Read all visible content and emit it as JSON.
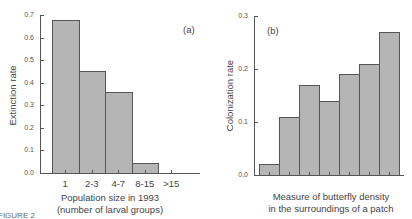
{
  "chart_data": [
    {
      "type": "bar",
      "panel": "(a)",
      "title": "",
      "xlabel": "Population size in 1993",
      "xlabel_line2": "(number of larval groups)",
      "ylabel": "Extinction rate",
      "categories": [
        "1",
        "2-3",
        "4-7",
        "8-15",
        ">15"
      ],
      "values": [
        0.68,
        0.45,
        0.36,
        0.045,
        0.0
      ],
      "ylim": [
        0,
        0.7
      ],
      "yticks": [
        "0.0",
        "0.1",
        "0.2",
        "0.3",
        "0.4",
        "0.5",
        "0.6",
        "0.7"
      ],
      "grid": false
    },
    {
      "type": "bar",
      "panel": "(b)",
      "title": "",
      "xlabel": "Measure of butterfly density",
      "xlabel_line2": "in the surroundings of a patch",
      "ylabel": "Colonization rate",
      "categories": [
        "1",
        "2",
        "3",
        "4",
        "5",
        "6",
        "7"
      ],
      "values": [
        0.02,
        0.11,
        0.17,
        0.14,
        0.19,
        0.21,
        0.27
      ],
      "ylim": [
        0,
        0.3
      ],
      "yticks": [
        "0.0",
        "0.1",
        "0.2",
        "0.3"
      ],
      "grid": false
    }
  ],
  "caption_fragment": "FIGURE 2",
  "colors": {
    "bar_fill": "#b5b5b5",
    "bar_edge": "#555555",
    "axis": "#555555"
  }
}
